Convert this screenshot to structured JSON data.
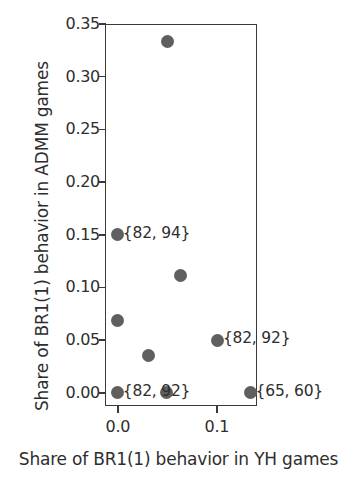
{
  "chart_data": {
    "type": "scatter",
    "title": "",
    "xlabel": "Share of BR1(1) behavior in YH games",
    "ylabel": "Share of BR1(1) behavior in ADMM games",
    "xlim": [
      -0.013,
      0.1405
    ],
    "ylim": [
      -0.0125,
      0.35
    ],
    "grid": false,
    "legend": null,
    "marker_color": "#5f5f5f",
    "axis_color": "#3a3a3a",
    "xticks": [
      0.0,
      0.1
    ],
    "xtick_labels": [
      "0.0",
      "0.1"
    ],
    "yticks": [
      0.0,
      0.05,
      0.1,
      0.15,
      0.2,
      0.25,
      0.3,
      0.35
    ],
    "ytick_labels": [
      "0.00",
      "0.05",
      "0.10",
      "0.15",
      "0.20",
      "0.25",
      "0.30",
      "0.35"
    ],
    "points": [
      {
        "x": 0.05,
        "y": 0.333,
        "label": ""
      },
      {
        "x": 0.0,
        "y": 0.15,
        "label": "{82, 94}"
      },
      {
        "x": 0.063,
        "y": 0.111,
        "label": ""
      },
      {
        "x": 0.0,
        "y": 0.069,
        "label": ""
      },
      {
        "x": 0.101,
        "y": 0.05,
        "label": "{82, 92}"
      },
      {
        "x": 0.031,
        "y": 0.035,
        "label": ""
      },
      {
        "x": 0.0,
        "y": 0.0,
        "label": "{82, 92}"
      },
      {
        "x": 0.049,
        "y": 0.0,
        "label": ""
      },
      {
        "x": 0.134,
        "y": 0.0,
        "label": "{65, 60}"
      }
    ],
    "annotations": [
      {
        "text": "{82, 94}",
        "x": 0.0,
        "y": 0.15
      },
      {
        "text": "{82, 92}",
        "x": 0.101,
        "y": 0.05
      },
      {
        "text": "{82, 92}",
        "x": 0.0,
        "y": 0.0
      },
      {
        "text": "{65, 60}",
        "x": 0.134,
        "y": 0.0
      }
    ]
  }
}
